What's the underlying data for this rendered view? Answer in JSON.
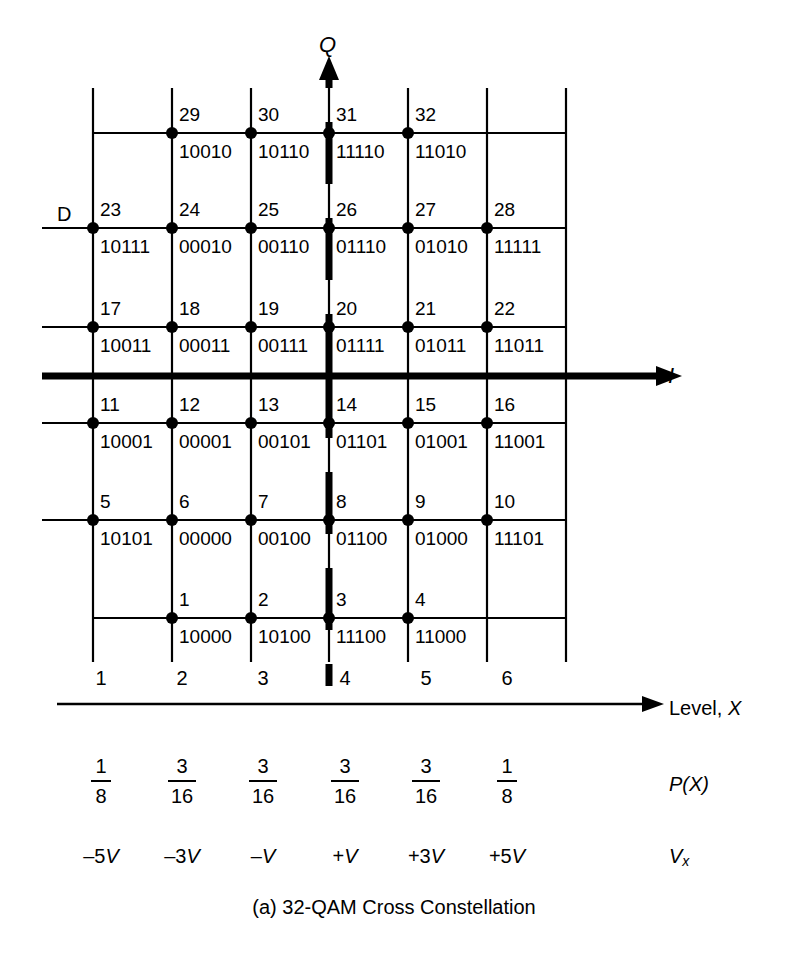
{
  "figure": {
    "caption": "(a) 32-QAM Cross Constellation",
    "axis_i_label": "I",
    "axis_q_label": "Q",
    "d_label": "D",
    "line_color": "#000000",
    "background": "#ffffff"
  },
  "chart_data": {
    "type": "scatter",
    "title": "(a) 32-QAM Cross Constellation",
    "xlabel": "I",
    "ylabel": "Q",
    "grid": true,
    "legend": null,
    "xlim": [
      -6,
      6
    ],
    "ylim": [
      -6,
      6
    ],
    "x_levels": [
      1,
      2,
      3,
      4,
      5,
      6
    ],
    "x_level_voltages": [
      "–5V",
      "–3V",
      "–V",
      "+V",
      "+3V",
      "+5V"
    ],
    "x_level_probabilities": [
      {
        "num": "1",
        "den": "8"
      },
      {
        "num": "3",
        "den": "16"
      },
      {
        "num": "3",
        "den": "16"
      },
      {
        "num": "3",
        "den": "16"
      },
      {
        "num": "3",
        "den": "16"
      },
      {
        "num": "1",
        "den": "8"
      }
    ],
    "points": [
      {
        "index": "29",
        "code": "10010",
        "col": 2,
        "row": 1
      },
      {
        "index": "30",
        "code": "10110",
        "col": 3,
        "row": 1
      },
      {
        "index": "31",
        "code": "11110",
        "col": 4,
        "row": 1
      },
      {
        "index": "32",
        "code": "11010",
        "col": 5,
        "row": 1
      },
      {
        "index": "23",
        "code": "10111",
        "col": 1,
        "row": 2
      },
      {
        "index": "24",
        "code": "00010",
        "col": 2,
        "row": 2
      },
      {
        "index": "25",
        "code": "00110",
        "col": 3,
        "row": 2
      },
      {
        "index": "26",
        "code": "01110",
        "col": 4,
        "row": 2
      },
      {
        "index": "27",
        "code": "01010",
        "col": 5,
        "row": 2
      },
      {
        "index": "28",
        "code": "11111",
        "col": 6,
        "row": 2
      },
      {
        "index": "17",
        "code": "10011",
        "col": 1,
        "row": 3
      },
      {
        "index": "18",
        "code": "00011",
        "col": 2,
        "row": 3
      },
      {
        "index": "19",
        "code": "00111",
        "col": 3,
        "row": 3
      },
      {
        "index": "20",
        "code": "01111",
        "col": 4,
        "row": 3
      },
      {
        "index": "21",
        "code": "01011",
        "col": 5,
        "row": 3
      },
      {
        "index": "22",
        "code": "11011",
        "col": 6,
        "row": 3
      },
      {
        "index": "11",
        "code": "10001",
        "col": 1,
        "row": 4
      },
      {
        "index": "12",
        "code": "00001",
        "col": 2,
        "row": 4
      },
      {
        "index": "13",
        "code": "00101",
        "col": 3,
        "row": 4
      },
      {
        "index": "14",
        "code": "01101",
        "col": 4,
        "row": 4
      },
      {
        "index": "15",
        "code": "01001",
        "col": 5,
        "row": 4
      },
      {
        "index": "16",
        "code": "11001",
        "col": 6,
        "row": 4
      },
      {
        "index": "5",
        "code": "10101",
        "col": 1,
        "row": 5
      },
      {
        "index": "6",
        "code": "00000",
        "col": 2,
        "row": 5
      },
      {
        "index": "7",
        "code": "00100",
        "col": 3,
        "row": 5
      },
      {
        "index": "8",
        "code": "01100",
        "col": 4,
        "row": 5
      },
      {
        "index": "9",
        "code": "01000",
        "col": 5,
        "row": 5
      },
      {
        "index": "10",
        "code": "11101",
        "col": 6,
        "row": 5
      },
      {
        "index": "1",
        "code": "10000",
        "col": 2,
        "row": 6
      },
      {
        "index": "2",
        "code": "10100",
        "col": 3,
        "row": 6
      },
      {
        "index": "3",
        "code": "11100",
        "col": 4,
        "row": 6
      },
      {
        "index": "4",
        "code": "11000",
        "col": 5,
        "row": 6
      }
    ]
  },
  "level_axis": {
    "label_text": "Level, ",
    "label_ital": "X",
    "numbers": [
      "1",
      "2",
      "3",
      "4",
      "5",
      "6"
    ]
  },
  "probability_row": {
    "label_open": "P(",
    "label_ital": "X",
    "label_close": ")",
    "values": [
      {
        "num": "1",
        "den": "8"
      },
      {
        "num": "3",
        "den": "16"
      },
      {
        "num": "3",
        "den": "16"
      },
      {
        "num": "3",
        "den": "16"
      },
      {
        "num": "3",
        "den": "16"
      },
      {
        "num": "1",
        "den": "8"
      }
    ]
  },
  "voltage_row": {
    "label_ital": "V",
    "label_sub": "x",
    "values": [
      {
        "sign": "–",
        "mag": "5",
        "unit": "V"
      },
      {
        "sign": "–",
        "mag": "3",
        "unit": "V"
      },
      {
        "sign": "–",
        "mag": "",
        "unit": "V"
      },
      {
        "sign": "+",
        "mag": "",
        "unit": "V"
      },
      {
        "sign": "+",
        "mag": "3",
        "unit": "V"
      },
      {
        "sign": "+",
        "mag": "5",
        "unit": "V"
      }
    ]
  }
}
